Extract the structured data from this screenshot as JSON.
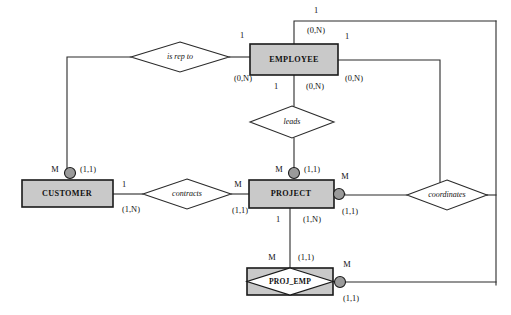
{
  "diagram": {
    "notation": "chen-with-participation",
    "colors": {
      "entity_fill": "#c9c9c9",
      "entity_stroke": "#1a1a1a",
      "line": "#2b2b2b",
      "dot_fill": "#9a9a9a",
      "background": "#ffffff"
    },
    "entities": [
      {
        "id": "employee",
        "label": "EMPLOYEE",
        "type": "strong",
        "x": 250,
        "y": 44,
        "w": 88,
        "h": 31
      },
      {
        "id": "customer",
        "label": "CUSTOMER",
        "type": "strong",
        "x": 22,
        "y": 180,
        "w": 91,
        "h": 27
      },
      {
        "id": "project",
        "label": "PROJECT",
        "type": "strong",
        "x": 249,
        "y": 180,
        "w": 85,
        "h": 28
      },
      {
        "id": "proj_emp",
        "label": "PROJ_EMP",
        "type": "associative",
        "x": 247,
        "y": 268,
        "w": 86,
        "h": 27
      }
    ],
    "relationships": [
      {
        "id": "is-rep-to",
        "label": "is rep to",
        "cx": 180,
        "cy": 57,
        "rx": 49,
        "ry": 15
      },
      {
        "id": "leads",
        "label": "leads",
        "cx": 292,
        "cy": 122,
        "rx": 42,
        "ry": 16
      },
      {
        "id": "contracts",
        "label": "contracts",
        "cx": 187,
        "cy": 194,
        "rx": 44,
        "ry": 15
      },
      {
        "id": "coordinates",
        "label": "coordinates",
        "cx": 447,
        "cy": 195,
        "rx": 40,
        "ry": 15
      }
    ],
    "cardinality_labels": [
      {
        "id": "emp-top-one",
        "text": "1",
        "x": 316,
        "y": 11
      },
      {
        "id": "emp-top-part",
        "text": "(0,N)",
        "x": 316,
        "y": 31
      },
      {
        "id": "isrepto-emp-one",
        "text": "1",
        "x": 242,
        "y": 36
      },
      {
        "id": "isrepto-emp-part",
        "text": "(0,N)",
        "x": 243,
        "y": 79
      },
      {
        "id": "emp-right-one",
        "text": "1",
        "x": 347,
        "y": 37
      },
      {
        "id": "emp-right-part",
        "text": "(0,N)",
        "x": 354,
        "y": 79
      },
      {
        "id": "leads-emp-one",
        "text": "1",
        "x": 276,
        "y": 87
      },
      {
        "id": "leads-emp-part",
        "text": "(0,N)",
        "x": 315,
        "y": 87
      },
      {
        "id": "cust-top-m",
        "text": "M",
        "x": 55,
        "y": 170
      },
      {
        "id": "cust-top-part",
        "text": "(1,1)",
        "x": 88,
        "y": 170
      },
      {
        "id": "cust-right-one",
        "text": "1",
        "x": 124,
        "y": 185
      },
      {
        "id": "cust-right-part",
        "text": "(1,N)",
        "x": 131,
        "y": 210
      },
      {
        "id": "contracts-proj-m",
        "text": "M",
        "x": 238,
        "y": 185
      },
      {
        "id": "contracts-proj-part",
        "text": "(1,1)",
        "x": 240,
        "y": 211
      },
      {
        "id": "proj-top-m",
        "text": "M",
        "x": 279,
        "y": 170
      },
      {
        "id": "proj-top-part",
        "text": "(1,1)",
        "x": 312,
        "y": 170
      },
      {
        "id": "proj-right-m",
        "text": "M",
        "x": 345,
        "y": 177
      },
      {
        "id": "proj-right-part",
        "text": "(1,1)",
        "x": 350,
        "y": 212
      },
      {
        "id": "proj-bottom-one",
        "text": "1",
        "x": 278,
        "y": 220
      },
      {
        "id": "proj-bottom-part",
        "text": "(1,N)",
        "x": 312,
        "y": 220
      },
      {
        "id": "projemp-top-m",
        "text": "M",
        "x": 272,
        "y": 258
      },
      {
        "id": "projemp-top-part",
        "text": "(1,1)",
        "x": 306,
        "y": 258
      },
      {
        "id": "projemp-right-m",
        "text": "M",
        "x": 347,
        "y": 265
      },
      {
        "id": "projemp-right-part",
        "text": "(1,1)",
        "x": 351,
        "y": 299
      }
    ],
    "connection_dots": [
      {
        "id": "dot-customer-top",
        "cx": 70,
        "cy": 173,
        "r": 5.5
      },
      {
        "id": "dot-project-top",
        "cx": 294,
        "cy": 173,
        "r": 5.5
      },
      {
        "id": "dot-project-right",
        "cx": 339,
        "cy": 194,
        "r": 5.5
      },
      {
        "id": "dot-projemp-right",
        "cx": 340,
        "cy": 282,
        "r": 5.5
      }
    ],
    "connections": [
      {
        "id": "employee-to-top-rail",
        "points": "294,44 294,21 496,21"
      },
      {
        "id": "outer-right-rail",
        "points": "496,21 496,285"
      },
      {
        "id": "projemp-to-outer-rail",
        "points": "346,282 496,282"
      },
      {
        "id": "employee-right-to-coord",
        "points": "338,60 440,60 440,195 487,195"
      },
      {
        "id": "coord-to-outer-rail",
        "points": "487,195 496,195"
      },
      {
        "id": "isrepto-to-employee",
        "points": "229,57 250,57"
      },
      {
        "id": "isrepto-to-customer",
        "points": "131,57 67,57 67,170"
      },
      {
        "id": "employee-to-leads",
        "points": "294,75 294,106"
      },
      {
        "id": "leads-to-project",
        "points": "294,138 294,170"
      },
      {
        "id": "customer-to-contracts",
        "points": "113,194 143,194"
      },
      {
        "id": "contracts-to-project",
        "points": "231,194 249,194"
      },
      {
        "id": "project-to-projemp",
        "points": "290,208 290,268"
      },
      {
        "id": "project-right-stub",
        "points": "334,194 345,194"
      },
      {
        "id": "coord-left-stub",
        "points": "407,195 345,195"
      }
    ]
  }
}
